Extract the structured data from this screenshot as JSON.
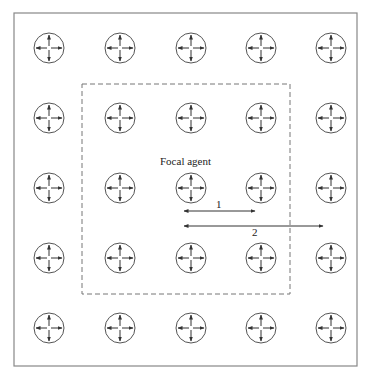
{
  "diagram": {
    "type": "agent-grid-neighborhood",
    "grid": {
      "rows": 5,
      "cols": 5,
      "x": [
        49,
        120,
        191,
        261,
        331
      ],
      "y": [
        48,
        118,
        188,
        258,
        328
      ],
      "agent_radius": 15
    },
    "frame": {
      "x": 14,
      "y": 13,
      "w": 343,
      "h": 353
    },
    "neighborhood_box": {
      "x": 82,
      "y": 84,
      "w": 208,
      "h": 210,
      "style": "dashed"
    },
    "focal_agent": {
      "row": 2,
      "col": 2,
      "label": "Focal agent"
    },
    "distance_arrows": [
      {
        "label": "1",
        "x1": 184,
        "x2": 255,
        "y": 211
      },
      {
        "label": "2",
        "x1": 184,
        "x2": 323,
        "y": 226
      }
    ],
    "colors": {
      "line": "#555555",
      "frame": "#888888",
      "dash": "#777777"
    }
  }
}
